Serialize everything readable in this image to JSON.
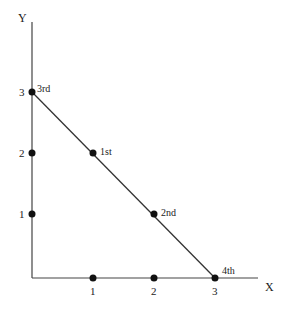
{
  "diagram": {
    "axis_x_label": "X",
    "axis_y_label": "Y",
    "x_ticks": [
      "1",
      "2",
      "3"
    ],
    "y_ticks": [
      "1",
      "2",
      "3"
    ],
    "point_labels": {
      "first": "1st",
      "second": "2nd",
      "third": "3rd",
      "fourth": "4th"
    },
    "points": [
      {
        "x": 0,
        "y": 1
      },
      {
        "x": 0,
        "y": 2
      },
      {
        "x": 0,
        "y": 3,
        "label": "3rd"
      },
      {
        "x": 1,
        "y": 0
      },
      {
        "x": 2,
        "y": 0
      },
      {
        "x": 3,
        "y": 0,
        "label": "4th"
      },
      {
        "x": 1,
        "y": 2,
        "label": "1st"
      },
      {
        "x": 2,
        "y": 1,
        "label": "2nd"
      }
    ],
    "line": {
      "from": [
        0,
        3
      ],
      "to": [
        3,
        0
      ]
    },
    "colors": {
      "stroke": "#333333",
      "point": "#111111"
    }
  }
}
